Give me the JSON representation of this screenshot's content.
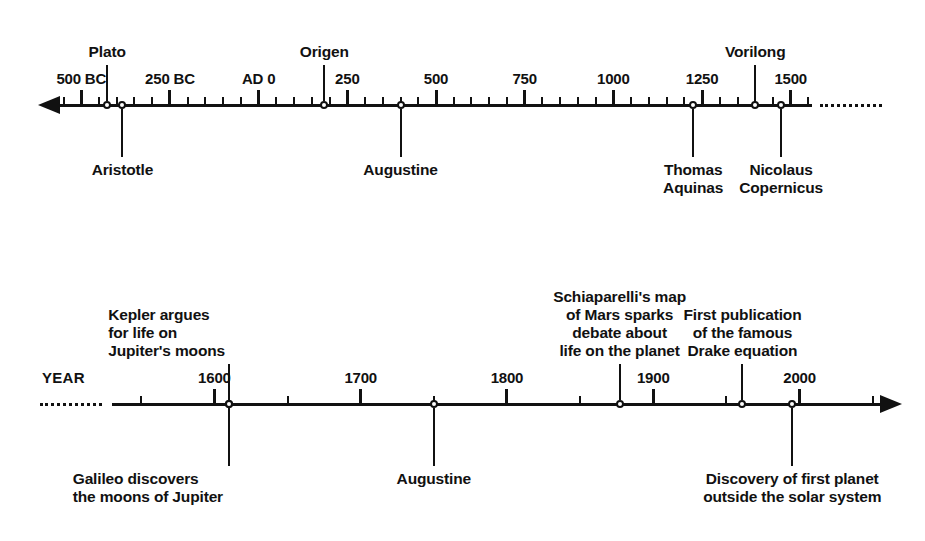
{
  "figure": {
    "kind": "timeline-diagram",
    "background": "#ffffff",
    "ink_color": "#111111",
    "width": 925,
    "height": 541
  },
  "timelines": [
    {
      "id": "ancient-to-renaissance",
      "axis_label": "",
      "axis_y": 105,
      "domain": [
        -560,
        1560
      ],
      "pixel_span": [
        60,
        812
      ],
      "left_arrow": true,
      "right_arrow": false,
      "left_dots": false,
      "right_dots": true,
      "major_tick_step": 250,
      "minor_tick_step": 50,
      "ticks": [
        {
          "value": -500,
          "label": "500 BC"
        },
        {
          "value": -250,
          "label": "250 BC"
        },
        {
          "value": 0,
          "label": "AD 0"
        },
        {
          "value": 250,
          "label": "250"
        },
        {
          "value": 500,
          "label": "500"
        },
        {
          "value": 750,
          "label": "750"
        },
        {
          "value": 1000,
          "label": "1000"
        },
        {
          "value": 1250,
          "label": "1250"
        },
        {
          "value": 1500,
          "label": "1500"
        }
      ],
      "events": [
        {
          "value": -427,
          "label": "Plato",
          "side": "above",
          "align": "center",
          "leader": 36,
          "gap": 4
        },
        {
          "value": -384,
          "label": "Aristotle",
          "side": "below",
          "align": "center",
          "leader": 48,
          "gap": 4
        },
        {
          "value": 185,
          "label": "Origen",
          "side": "above",
          "align": "center",
          "leader": 36,
          "gap": 4
        },
        {
          "value": 400,
          "label": "Augustine",
          "side": "below",
          "align": "center",
          "leader": 48,
          "gap": 4
        },
        {
          "value": 1225,
          "label": "Thomas\nAquinas",
          "side": "below",
          "align": "center",
          "leader": 48,
          "gap": 4
        },
        {
          "value": 1400,
          "label": "Vorilong",
          "side": "above",
          "align": "center",
          "leader": 36,
          "gap": 4
        },
        {
          "value": 1473,
          "label": "Nicolaus\nCopernicus",
          "side": "below",
          "align": "center",
          "leader": 48,
          "gap": 4
        }
      ]
    },
    {
      "id": "renaissance-to-modern",
      "axis_label": "YEAR",
      "axis_y": 404,
      "domain": [
        1530,
        2055
      ],
      "pixel_span": [
        112,
        880
      ],
      "left_arrow": false,
      "right_arrow": true,
      "left_dots": true,
      "right_dots": false,
      "major_tick_step": 100,
      "minor_tick_step": 50,
      "ticks": [
        {
          "value": 1600,
          "label": "1600"
        },
        {
          "value": 1700,
          "label": "1700"
        },
        {
          "value": 1800,
          "label": "1800"
        },
        {
          "value": 1900,
          "label": "1900"
        },
        {
          "value": 2000,
          "label": "2000"
        }
      ],
      "events": [
        {
          "value": 1610,
          "label": "Kepler argues\nfor life on\nJupiter's moons",
          "side": "above",
          "align": "left",
          "leader": 36,
          "gap": 4
        },
        {
          "value": 1610,
          "label": "Galileo discovers\nthe moons of Jupiter",
          "side": "below",
          "align": "left",
          "leader": 58,
          "gap": 4
        },
        {
          "value": 1750,
          "label": "Augustine",
          "side": "below",
          "align": "center",
          "leader": 58,
          "gap": 4
        },
        {
          "value": 1877,
          "label": "Schiaparelli's map\nof Mars sparks\ndebate about\nlife on the planet",
          "side": "above",
          "align": "center",
          "leader": 36,
          "gap": 4
        },
        {
          "value": 1961,
          "label": "First publication\nof the famous\nDrake equation",
          "side": "above",
          "align": "center",
          "leader": 36,
          "gap": 4
        },
        {
          "value": 1995,
          "label": "Discovery of first planet\noutside the solar system",
          "side": "below",
          "align": "center",
          "leader": 58,
          "gap": 4
        }
      ]
    }
  ]
}
